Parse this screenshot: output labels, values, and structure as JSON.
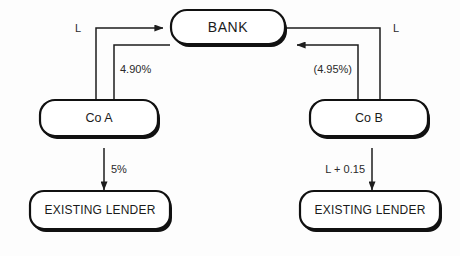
{
  "diagram": {
    "background_color": "#fdfdfd",
    "line_color": "#1d1d1d",
    "text_color": "#1b1b1b",
    "nodes": {
      "bank": {
        "label": "BANK"
      },
      "co_a": {
        "label": "Co A"
      },
      "co_b": {
        "label": "Co B"
      },
      "lender_a": {
        "label": "EXISTING LENDER"
      },
      "lender_b": {
        "label": "EXISTING LENDER"
      }
    },
    "edge_labels": {
      "left_floating": "L",
      "left_fixed": "4.90%",
      "right_floating": "L",
      "right_fixed": "(4.95%)",
      "left_existing": "5%",
      "right_existing": "L + 0.15"
    }
  }
}
